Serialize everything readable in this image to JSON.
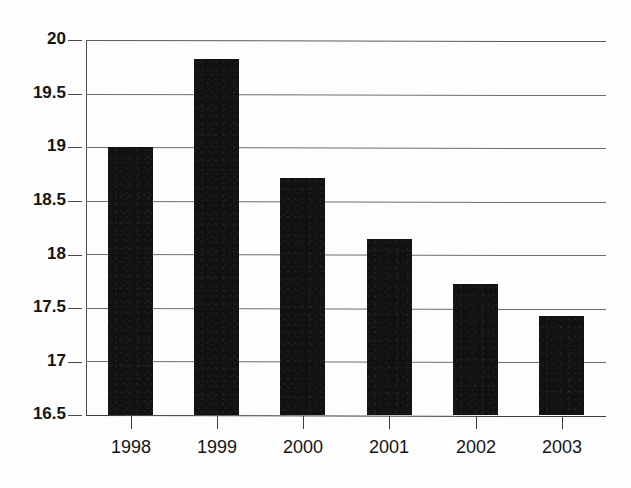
{
  "chart_data": {
    "type": "bar",
    "title": "",
    "subtitle": "",
    "xlabel": "",
    "ylabel": "",
    "categories": [
      "1998",
      "1999",
      "2000",
      "2001",
      "2002",
      "2003"
    ],
    "values": [
      19.0,
      19.82,
      18.71,
      18.14,
      17.72,
      17.42
    ],
    "series": [
      {
        "name": "",
        "values": [
          19.0,
          19.82,
          18.71,
          18.14,
          17.72,
          17.42
        ]
      }
    ],
    "ylim": [
      16.5,
      20
    ],
    "y_ticks": [
      20,
      19.5,
      19,
      18.5,
      18,
      17.5,
      17,
      16.5
    ],
    "y_tick_labels": [
      "20",
      "19.5",
      "19",
      "18.5",
      "18",
      "17.5",
      "17",
      "16.5"
    ],
    "grid": true,
    "grid_axis": "y",
    "legend": false,
    "legend_position": "none",
    "annotations": [],
    "bar_color": "#121212",
    "grid_color": "#6f6f6f",
    "axis_color": "#4a4a4a",
    "background_color": "#ffffff"
  }
}
